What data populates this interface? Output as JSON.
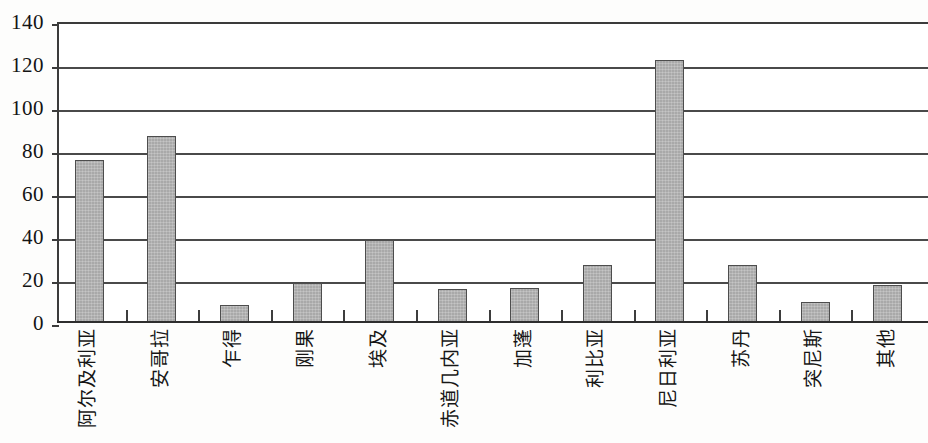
{
  "chart_data": {
    "type": "bar",
    "title": "",
    "subtitle": "",
    "xlabel": "",
    "ylabel": "",
    "categories": [
      "阿尔及利亚",
      "安哥拉",
      "乍得",
      "刚果",
      "埃及",
      "赤道几内亚",
      "加蓬",
      "利比亚",
      "尼日利亚",
      "苏丹",
      "突尼斯",
      "其他"
    ],
    "values": [
      76,
      87,
      8.5,
      18.5,
      38.5,
      16,
      16.5,
      27,
      122.5,
      27,
      10,
      17.5
    ],
    "series": [
      {
        "name": "",
        "values": [
          76,
          87,
          8.5,
          18.5,
          38.5,
          16,
          16.5,
          27,
          122.5,
          27,
          10,
          17.5
        ]
      }
    ],
    "ylim": [
      0,
      140
    ],
    "ytick_step": 20,
    "ytick_labels": [
      "0",
      "20",
      "40",
      "60",
      "80",
      "100",
      "120",
      "140"
    ],
    "ytick_values": [
      0,
      20,
      40,
      60,
      80,
      100,
      120,
      140
    ],
    "grid": "horizontal",
    "legend": "none",
    "bar_color": "#a9a9a9",
    "bar_edge_color": "#4d4d4d",
    "axis_color": "#3b3b3b",
    "background_color": "#ffffff",
    "label_rotation": 90,
    "annotations": []
  }
}
